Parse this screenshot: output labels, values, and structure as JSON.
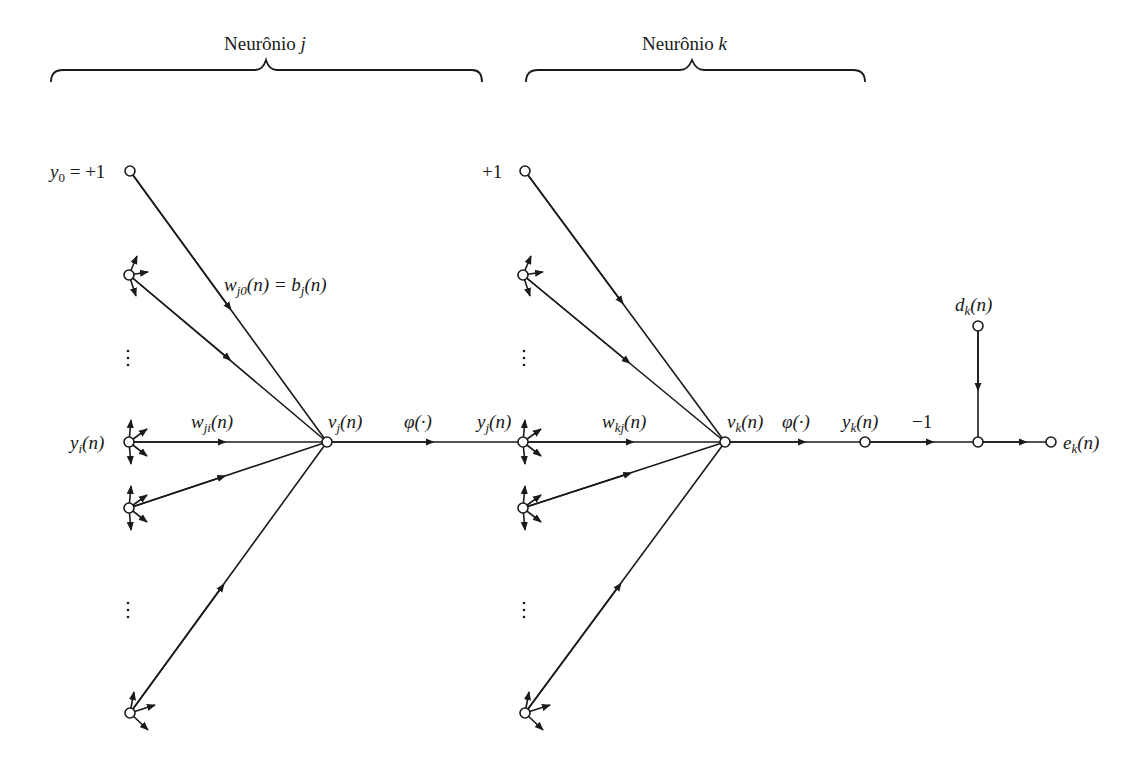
{
  "diagram": {
    "type": "signal-flow-graph",
    "sections": [
      {
        "id": "neuron-j",
        "label_prefix": "Neurônio",
        "label_var": "j"
      },
      {
        "id": "neuron-k",
        "label_prefix": "Neurônio",
        "label_var": "k"
      }
    ],
    "labels": {
      "y0": {
        "var": "y",
        "sub": "0",
        "rest": " = +1"
      },
      "plus_one": "+1",
      "wj0": {
        "var": "w",
        "sub": "j0",
        "mid": "(n) = ",
        "var2": "b",
        "sub2": "j",
        "rest": "(n)"
      },
      "yi": {
        "var": "y",
        "sub": "i",
        "rest": "(n)"
      },
      "wji": {
        "var": "w",
        "sub": "ji",
        "rest": "(n)"
      },
      "vj": {
        "var": "v",
        "sub": "j",
        "rest": "(n)"
      },
      "phi_j": "φ(·)",
      "yj": {
        "var": "y",
        "sub": "j",
        "rest": "(n)"
      },
      "wkj": {
        "var": "w",
        "sub": "kj",
        "rest": "(n)"
      },
      "vk": {
        "var": "v",
        "sub": "k",
        "rest": "(n)"
      },
      "phi_k": "φ(·)",
      "yk": {
        "var": "y",
        "sub": "k",
        "rest": "(n)"
      },
      "minus_one": "−1",
      "dk": {
        "var": "d",
        "sub": "k",
        "rest": "(n)"
      },
      "ek": {
        "var": "e",
        "sub": "k",
        "rest": "(n)"
      }
    },
    "ellipsis": "⋮"
  }
}
